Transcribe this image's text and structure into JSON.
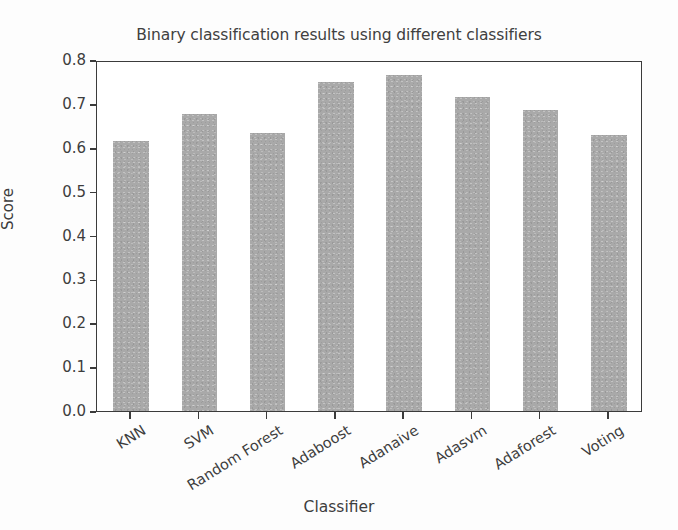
{
  "chart_data": {
    "type": "bar",
    "title": "Binary classification results using different classifiers",
    "xlabel": "Classifier",
    "ylabel": "Score",
    "categories": [
      "KNN",
      "SVM",
      "Random Forest",
      "Adaboost",
      "Adanaive",
      "Adasvm",
      "Adaforest",
      "Voting"
    ],
    "values": [
      0.615,
      0.678,
      0.633,
      0.75,
      0.766,
      0.716,
      0.686,
      0.629
    ],
    "ylim": [
      0.0,
      0.8
    ],
    "ytick_labels": [
      "0.0",
      "0.1",
      "0.2",
      "0.3",
      "0.4",
      "0.5",
      "0.6",
      "0.7",
      "0.8"
    ],
    "ytick_values": [
      0.0,
      0.1,
      0.2,
      0.3,
      0.4,
      0.5,
      0.6,
      0.7,
      0.8
    ],
    "grid": false,
    "legend": null,
    "bar_color": "#a9a9a9",
    "axis_color": "#3b3b3b",
    "text_color": "#3d3d3d",
    "background": "#ffffff"
  }
}
